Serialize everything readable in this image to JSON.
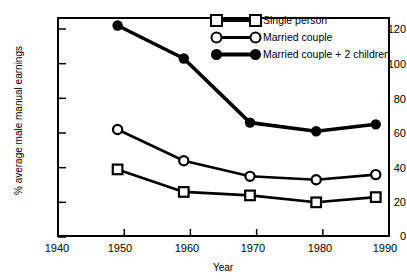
{
  "chart_data": {
    "type": "line",
    "title": "",
    "xlabel": "Year",
    "ylabel": "% average male manual earnings",
    "x": [
      1949,
      1959,
      1969,
      1979,
      1988
    ],
    "xlim": [
      1940,
      1990
    ],
    "ylim": [
      0,
      130
    ],
    "grid": false,
    "xticks": [
      1940,
      1950,
      1960,
      1970,
      1980,
      1990
    ],
    "yticks": [
      0,
      20,
      40,
      60,
      80,
      100,
      120
    ],
    "legend_position": "top-right",
    "series": [
      {
        "name": "Single person",
        "marker": "open-square",
        "values": [
          39,
          26,
          24,
          20,
          23
        ]
      },
      {
        "name": "Married couple",
        "marker": "open-circle",
        "values": [
          62,
          44,
          35,
          33,
          36
        ]
      },
      {
        "name": "Married couple + 2 children",
        "marker": "filled-circle",
        "values": [
          122,
          103,
          66,
          61,
          65
        ]
      }
    ]
  },
  "axis": {
    "y_title": "% average male manual earnings",
    "x_title": "Year",
    "y_tick_labels": [
      "120",
      "100",
      "80",
      "60",
      "40",
      "20",
      "0"
    ],
    "x_tick_labels": [
      "1940",
      "1950",
      "1960",
      "1970",
      "1980",
      "1990"
    ]
  },
  "legend": {
    "items": [
      {
        "label": "Single person",
        "marker": "open-square"
      },
      {
        "label": "Married couple",
        "marker": "open-circle"
      },
      {
        "label": "Married couple + 2 children",
        "marker": "filled-circle"
      }
    ]
  },
  "colors": {
    "line": "#000000",
    "axis": "#000000",
    "background": "#ffffff",
    "marker_fill": "#ffffff"
  }
}
